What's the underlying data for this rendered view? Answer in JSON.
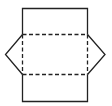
{
  "diagram": {
    "type": "net",
    "stroke_color": "#222222",
    "background": "#ffffff",
    "stroke_width": 1.3,
    "dash_pattern": "4 2.5",
    "rectangle": {
      "x1": 22.5,
      "y1": 8.5,
      "x2": 87.5,
      "y2": 101.5
    },
    "fold_lines": [
      {
        "orientation": "horizontal",
        "y": 34.5,
        "x1": 22.5,
        "x2": 87.5
      },
      {
        "orientation": "horizontal",
        "y": 74.5,
        "x1": 22.5,
        "x2": 87.5
      },
      {
        "orientation": "vertical",
        "x": 22.5,
        "y1": 34.5,
        "y2": 74.5
      },
      {
        "orientation": "vertical",
        "x": 87.5,
        "y1": 34.5,
        "y2": 74.5
      }
    ],
    "flaps": [
      {
        "side": "left",
        "points": "22.5,34.5 5.5,54.5 22.5,74.5"
      },
      {
        "side": "right",
        "points": "87.5,34.5 105,54.5 87.5,74.5"
      }
    ]
  }
}
